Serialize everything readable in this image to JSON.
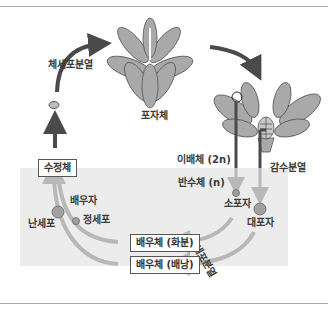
{
  "diagram": {
    "title": "",
    "nodes": {
      "sporophyte": "포자체",
      "diploid": "이배체 (2n)",
      "haploid": "반수체 (n)",
      "microspore": "소포자",
      "megaspore": "대포자",
      "gametophyte_pollen": "배우체 (화분)",
      "gametophyte_ovule": "배우체 (배낭)",
      "gamete": "배우자",
      "sperm": "정세포",
      "egg": "난세포",
      "zygote": "수정체"
    },
    "processes": {
      "mitosis_top": "체세포분열",
      "meiosis": "감수분열",
      "mitosis_bottom": "체세포분열"
    },
    "colors": {
      "haploid_region": "#ececec",
      "arrow_dark": "#4a4a4a",
      "arrow_light": "#b8b8b8",
      "petal": "#a9a9a9",
      "circle": "#a0a0a0"
    }
  }
}
